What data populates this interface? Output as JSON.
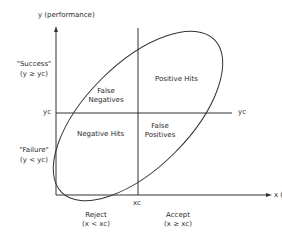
{
  "diagram": {
    "y_axis_label": "y (performance)",
    "x_axis_label": "x (judgment)",
    "y_threshold_label_left": "yc",
    "y_threshold_label_right": "yc",
    "x_threshold_label": "xc",
    "success_label": "\"Success\"",
    "success_condition": "(y ≥ yc)",
    "failure_label": "\"Failure\"",
    "failure_condition": "(y < yc)",
    "reject_label": "Reject",
    "reject_condition": "(x < xc)",
    "accept_label": "Accept",
    "accept_condition": "(x ≥ xc)",
    "quadrants": {
      "false_negatives_line1": "False",
      "false_negatives_line2": "Negatives",
      "positive_hits": "Positive Hits",
      "negative_hits": "Negative Hits",
      "false_positives_line1": "False",
      "false_positives_line2": "Positives"
    },
    "colors": {
      "line": "#333333",
      "background": "#ffffff"
    }
  }
}
